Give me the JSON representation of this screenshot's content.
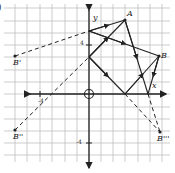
{
  "figure": {
    "corner_label": ")",
    "grid": {
      "x_lines": [
        15,
        27,
        40,
        52,
        65,
        77,
        89,
        101,
        113,
        125,
        138,
        150,
        162
      ],
      "y_lines": [
        8,
        21,
        33,
        45,
        57,
        70,
        82,
        94,
        107,
        119,
        131,
        143,
        155
      ],
      "color": "#b8b8b8"
    },
    "axes": {
      "origin": [
        89,
        94
      ],
      "x_label": "x",
      "y_label": "y",
      "tick_label_pos_y": "4",
      "tick_label_neg_y": "-4",
      "tick_label_neg_x": "-4",
      "color": "#222222"
    },
    "points": {
      "A": {
        "label": "A",
        "x": 125,
        "y": 20
      },
      "B": {
        "label": "B",
        "x": 159,
        "y": 56
      },
      "B_prime": {
        "label": "B'",
        "x": 15,
        "y": 56
      },
      "B_double_prime": {
        "label": "B''",
        "x": 15,
        "y": 130
      },
      "B_triple_prime": {
        "label": "B'''",
        "x": 160,
        "y": 132
      }
    },
    "solid_segments": [
      {
        "from": [
          89,
          31
        ],
        "to": [
          125,
          20
        ]
      },
      {
        "from": [
          125,
          20
        ],
        "to": [
          148,
          94
        ]
      },
      {
        "from": [
          89,
          31
        ],
        "to": [
          159,
          56
        ]
      },
      {
        "from": [
          159,
          56
        ],
        "to": [
          148,
          94
        ]
      },
      {
        "from": [
          89,
          57
        ],
        "to": [
          125,
          20
        ]
      },
      {
        "from": [
          89,
          57
        ],
        "to": [
          125,
          94
        ]
      },
      {
        "from": [
          125,
          94
        ],
        "to": [
          159,
          56
        ]
      }
    ],
    "dashed_segments": [
      {
        "from": [
          15,
          56
        ],
        "to": [
          89,
          31
        ]
      },
      {
        "from": [
          15,
          130
        ],
        "to": [
          89,
          57
        ]
      },
      {
        "from": [
          125,
          94
        ],
        "to": [
          160,
          132
        ]
      },
      {
        "from": [
          148,
          94
        ],
        "to": [
          160,
          132
        ]
      }
    ]
  }
}
